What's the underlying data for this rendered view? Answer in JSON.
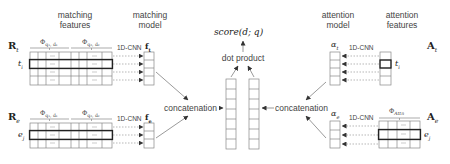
{
  "headers": {
    "matching_features": [
      "matching",
      "features"
    ],
    "matching_model": [
      "matching",
      "model"
    ],
    "attention_model": [
      "attention",
      "model"
    ],
    "attention_features": [
      "attention",
      "features"
    ]
  },
  "top": {
    "score": "score(d; q)",
    "dot_product": "dot product"
  },
  "left": {
    "Rt_symbol": "R",
    "Rt_sub": "t",
    "Re_symbol": "R",
    "Re_sub": "e",
    "phi_t1": "Φ",
    "phi_t1_sub": "q₁, d₁",
    "phi_t2": "Φ",
    "phi_t2_sub": "q₂, d₂",
    "phi_e1": "Φ",
    "phi_e1_sub": "q₁, d₁",
    "phi_e2": "Φ",
    "phi_e2_sub": "q₂, d₂",
    "ti": "t",
    "ti_sub": "i",
    "ej": "e",
    "ej_sub": "j",
    "cnn_t": "1D-CNN",
    "cnn_e": "1D-CNN",
    "ft": "f",
    "ft_sub": "t",
    "fe": "f",
    "fe_sub": "e",
    "ellipsis": "..."
  },
  "center": {
    "concat_left": "concatenation",
    "concat_right": "concatenation"
  },
  "right": {
    "At_symbol": "A",
    "At_sub": "t",
    "Ae_symbol": "A",
    "Ae_sub": "e",
    "alpha_t": "α",
    "alpha_t_sub": "t",
    "alpha_e": "α",
    "alpha_e_sub": "e",
    "cnn_t": "1D-CNN",
    "cnn_e": "1D-CNN",
    "ti": "t",
    "ti_sub": "i",
    "ej": "e",
    "ej_sub": "j",
    "phi_attn": "Φ",
    "phi_attn_sub": "Attn",
    "ellipsis": "..."
  },
  "colors": {
    "line": "#888888",
    "highlight": "#333333",
    "text": "#444444"
  }
}
